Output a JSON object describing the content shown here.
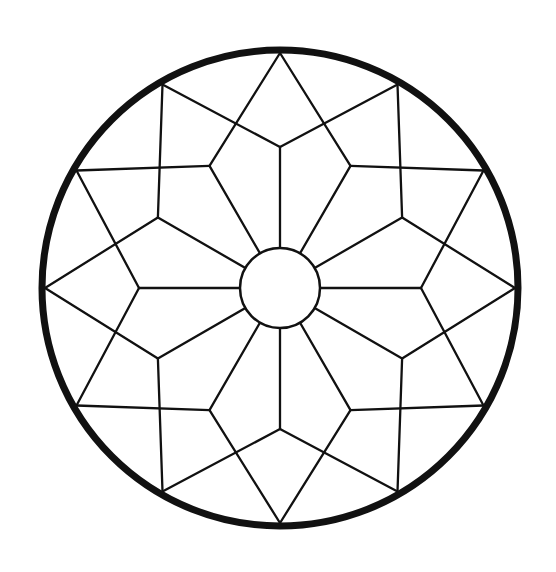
{
  "diagram": {
    "title": "",
    "type": "twelve-point geometric rosette",
    "colors": {
      "background": "#ffffff",
      "stroke": "#111111"
    },
    "center": [
      280,
      288
    ],
    "outer_circle": {
      "radius": 238,
      "stroke_width": 7
    },
    "inner_circle": {
      "radius": 40,
      "stroke_width": 2.5
    },
    "star_vertex_radius": 141,
    "points": 12,
    "line_width": 2.3
  }
}
